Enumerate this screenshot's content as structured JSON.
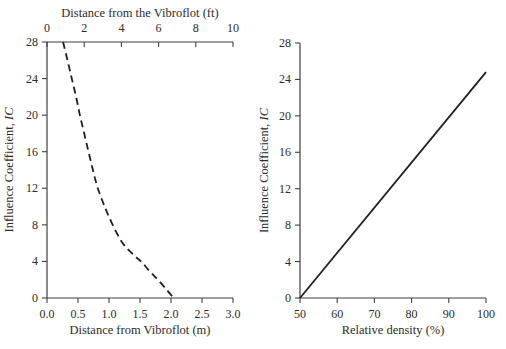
{
  "figure": {
    "background_color": "#ffffff",
    "ink_color": "#1f1f1f",
    "axis_color": "#3f3f3f"
  },
  "chart_data": [
    {
      "type": "line",
      "title": "",
      "xlabel": "Distance from Vibroflot (m)",
      "xlabel_top": "Distance from the Vibroflot (ft)",
      "ylabel": "Influence Coefficient, ",
      "ylabel_italic": "IC",
      "xlim": [
        0,
        3.0
      ],
      "xticks": [
        "0.0",
        "0.5",
        "1.0",
        "1.5",
        "2.0",
        "2.5",
        "3.0"
      ],
      "xlim_top": [
        0,
        10
      ],
      "xticks_top": [
        "0",
        "2",
        "4",
        "6",
        "8",
        "10"
      ],
      "ylim": [
        0,
        28
      ],
      "yticks": [
        "0",
        "4",
        "8",
        "12",
        "16",
        "20",
        "24",
        "28"
      ],
      "grid": false,
      "legend": "none",
      "series": [
        {
          "name": "influence-coefficient-vs-distance-curve",
          "line_style": "dashed",
          "color": "#1f1f1f",
          "points": [
            [
              0.26,
              28
            ],
            [
              0.33,
              26
            ],
            [
              0.4,
              24
            ],
            [
              0.47,
              22
            ],
            [
              0.53,
              20
            ],
            [
              0.6,
              18
            ],
            [
              0.67,
              16
            ],
            [
              0.74,
              14
            ],
            [
              0.82,
              12
            ],
            [
              0.93,
              10
            ],
            [
              1.06,
              8
            ],
            [
              1.22,
              6
            ],
            [
              1.4,
              4.7
            ],
            [
              1.53,
              3.9
            ],
            [
              1.66,
              2.9
            ],
            [
              1.79,
              2.0
            ],
            [
              1.93,
              0.9
            ],
            [
              2.03,
              0.1
            ]
          ]
        }
      ]
    },
    {
      "type": "line",
      "title": "",
      "xlabel": "Relative density (%)",
      "ylabel": "Influence Coefficient, ",
      "ylabel_italic": "IC",
      "xlim": [
        50,
        100
      ],
      "xticks": [
        "50",
        "60",
        "70",
        "80",
        "90",
        "100"
      ],
      "ylim": [
        0,
        28
      ],
      "yticks": [
        "0",
        "4",
        "8",
        "12",
        "16",
        "20",
        "24",
        "28"
      ],
      "grid": false,
      "legend": "none",
      "series": [
        {
          "name": "influence-coefficient-vs-relative-density-line",
          "line_style": "solid",
          "color": "#1f1f1f",
          "points": [
            [
              50,
              0
            ],
            [
              100,
              24.8
            ]
          ]
        }
      ]
    }
  ]
}
